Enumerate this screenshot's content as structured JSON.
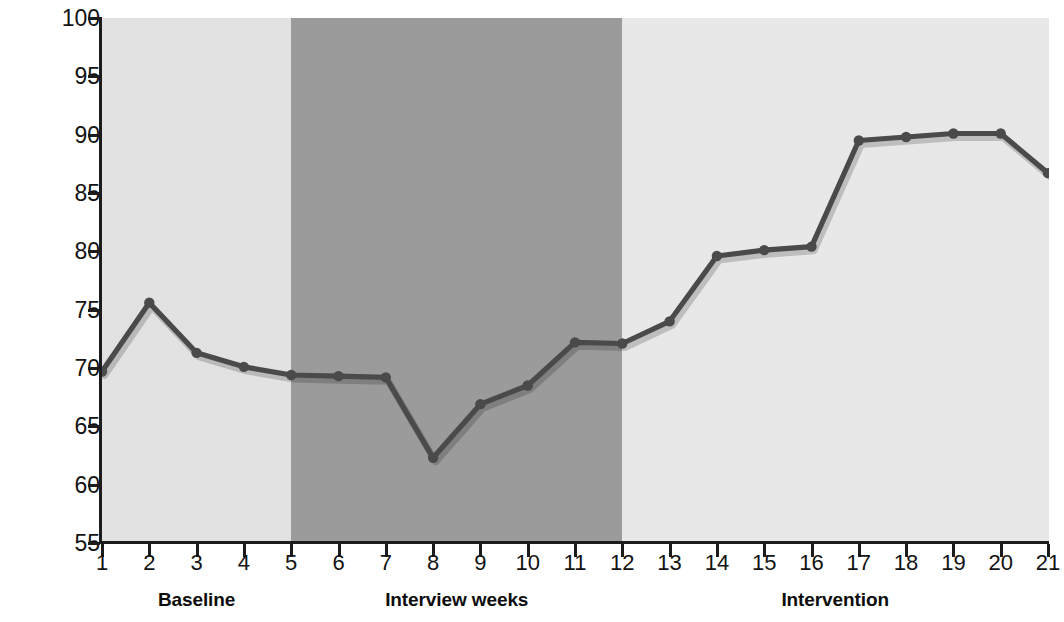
{
  "chart_data": {
    "type": "line",
    "title": "",
    "xlabel": "",
    "ylabel": "Percentage of record keeping",
    "x": [
      1,
      2,
      3,
      4,
      5,
      6,
      7,
      8,
      9,
      10,
      11,
      12,
      13,
      14,
      15,
      16,
      17,
      18,
      19,
      20,
      21
    ],
    "xtick_labels": [
      "1",
      "2",
      "3",
      "4",
      "5",
      "6",
      "7",
      "8",
      "9",
      "10",
      "11",
      "12",
      "13",
      "14",
      "15",
      "16",
      "17",
      "18",
      "19",
      "20",
      "21"
    ],
    "ytick_labels": [
      "55",
      "60",
      "65",
      "70",
      "75",
      "80",
      "85",
      "90",
      "95",
      "100"
    ],
    "yticks": [
      55,
      60,
      65,
      70,
      75,
      80,
      85,
      90,
      95,
      100
    ],
    "ylim": [
      55,
      100
    ],
    "xlim": [
      1,
      21
    ],
    "grid": false,
    "legend": "none",
    "series": [
      {
        "name": "Percentage of record keeping",
        "color": "#4a4a4a",
        "marker": "circle",
        "values": [
          69.7,
          75.6,
          71.3,
          70.1,
          69.4,
          69.3,
          69.2,
          62.3,
          66.9,
          68.5,
          72.2,
          72.1,
          74.0,
          79.6,
          80.1,
          80.4,
          89.5,
          89.8,
          90.1,
          90.1,
          86.7
        ]
      }
    ],
    "phase_bands": [
      {
        "label": "Baseline",
        "x_start": 1,
        "x_end": 5,
        "color": "#e2e2e2",
        "label_center_x": 3
      },
      {
        "label": "Interview weeks",
        "x_start": 5,
        "x_end": 12,
        "color": "#9b9b9b",
        "label_center_x": 8.5
      },
      {
        "label": "Intervention",
        "x_start": 12,
        "x_end": 21,
        "color": "#e8e8e8",
        "label_center_x": 16.5
      }
    ]
  },
  "colors": {
    "line": "#4a4a4a",
    "axis": "#1c1c1c",
    "text": "#131313",
    "band_baseline": "#e2e2e2",
    "band_interview": "#9b9b9b",
    "band_intervention": "#e8e8e8",
    "background": "#ffffff"
  }
}
